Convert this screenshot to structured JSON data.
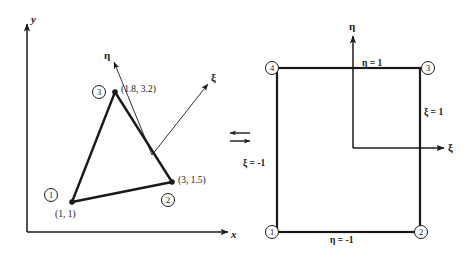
{
  "figure": {
    "global_axes": {
      "x_label": "x",
      "y_label": "y"
    },
    "physical_element": {
      "local_axes": {
        "xi_label": "ξ",
        "eta_label": "η"
      },
      "nodes": [
        {
          "number": "1",
          "coords": "(1, 1)"
        },
        {
          "number": "2",
          "coords": "(3, 1.5)"
        },
        {
          "number": "3",
          "coords": "(1.8, 3.2)"
        }
      ]
    },
    "mapping_arrow": "⇌",
    "parent_element": {
      "local_axes": {
        "xi_label": "ξ",
        "eta_label": "η"
      },
      "nodes": [
        {
          "number": "1"
        },
        {
          "number": "2"
        },
        {
          "number": "3"
        },
        {
          "number": "4"
        }
      ],
      "edges": [
        {
          "label": "η = 1"
        },
        {
          "label": "ξ = 1"
        },
        {
          "label": "ξ = -1"
        },
        {
          "label": "η = -1"
        }
      ]
    }
  },
  "colors": {
    "ink": "#1a1a1a",
    "background": "#ffffff"
  }
}
